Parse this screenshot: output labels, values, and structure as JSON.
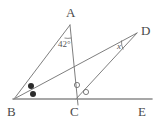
{
  "figure": {
    "type": "euclidean-geometry-diagram",
    "canvas": {
      "width": 161,
      "height": 122,
      "background": "#ffffff"
    },
    "stroke_color": "#6f6f6f",
    "baseline_color": "#8a8a8a",
    "label_color": "#4a4a4a",
    "mark_fill_color": "#2b2b2b",
    "points": [
      {
        "name": "A",
        "label": "A",
        "x": 70,
        "y": 25,
        "label_x": 66,
        "label_y": 17
      },
      {
        "name": "B",
        "label": "B",
        "x": 14,
        "y": 99,
        "label_x": 7,
        "label_y": 114
      },
      {
        "name": "C",
        "label": "C",
        "x": 76,
        "y": 99,
        "label_x": 71,
        "label_y": 114
      },
      {
        "name": "D",
        "label": "D",
        "x": 137,
        "y": 33,
        "label_x": 141,
        "label_y": 33
      },
      {
        "name": "E",
        "label": "E",
        "x": 152,
        "y": 99,
        "label_x": 139,
        "label_y": 114
      }
    ],
    "segments": [
      {
        "name": "segment-BA",
        "from": "B",
        "to": "A"
      },
      {
        "name": "segment-A-through-C",
        "from": "A",
        "to": "C-extended"
      },
      {
        "name": "segment-BD",
        "from": "B",
        "to": "D"
      },
      {
        "name": "segment-CD",
        "from": "C",
        "to": "D"
      },
      {
        "name": "line-BE",
        "from": "B",
        "to": "E"
      }
    ],
    "angles": [
      {
        "name": "angle-at-A",
        "vertex": "A",
        "label": "42°",
        "label_x": 58,
        "label_y": 44
      },
      {
        "name": "angle-at-D",
        "vertex": "D",
        "label": "x",
        "label_x": 118,
        "label_y": 47
      }
    ],
    "congruence_marks": [
      {
        "name": "angle-mark-B-upper",
        "style": "filled-dot",
        "x": 31,
        "y": 86
      },
      {
        "name": "angle-mark-B-lower",
        "style": "filled-dot",
        "x": 33,
        "y": 94
      },
      {
        "name": "angle-mark-C-upper",
        "style": "open-circle",
        "x": 77,
        "y": 85
      },
      {
        "name": "angle-mark-C-lower",
        "style": "open-circle",
        "x": 86,
        "y": 92
      }
    ]
  }
}
